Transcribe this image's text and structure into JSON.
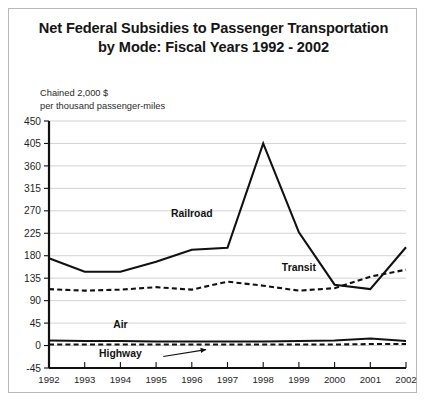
{
  "chart_data": {
    "type": "line",
    "title": "Net Federal Subsidies to Passenger Transportation by Mode: Fiscal Years 1992 - 2002",
    "title_line1": "Net Federal Subsidies to Passenger Transportation",
    "title_line2": "by Mode: Fiscal Years 1992 - 2002",
    "ylabel_line1": "Chained 2,000 $",
    "ylabel_line2": "per thousand passenger-miles",
    "xlabel": "",
    "ylim": [
      -45,
      450
    ],
    "yticks": [
      450,
      405,
      360,
      315,
      270,
      225,
      180,
      135,
      90,
      45,
      0,
      -45
    ],
    "ytick_labels": [
      "450",
      "405",
      "360",
      "315",
      "270",
      "225",
      "180",
      "135",
      "90",
      "45",
      "0",
      "-45"
    ],
    "categories": [
      1992,
      1993,
      1994,
      1995,
      1996,
      1997,
      1998,
      1999,
      2000,
      2001,
      2002
    ],
    "xtick_labels": [
      "1992",
      "1993",
      "1994",
      "1995",
      "1996",
      "1997",
      "1998",
      "1999",
      "2000",
      "2001",
      "2002"
    ],
    "grid": true,
    "legend_position": "inline-annotations",
    "series": [
      {
        "name": "Railroad",
        "style": "solid",
        "color": "#111111",
        "label_x": 1996,
        "label_y": 258,
        "values": [
          175,
          148,
          148,
          168,
          192,
          196,
          405,
          227,
          122,
          113,
          197
        ]
      },
      {
        "name": "Transit",
        "style": "dashed",
        "color": "#111111",
        "label_x": 1999,
        "label_y": 150,
        "values": [
          113,
          110,
          112,
          117,
          112,
          128,
          120,
          110,
          115,
          138,
          152
        ]
      },
      {
        "name": "Air",
        "style": "solid",
        "color": "#111111",
        "label_x": 1994,
        "label_y": 36,
        "values": [
          10,
          9,
          9,
          8,
          8,
          8,
          8,
          9,
          10,
          14,
          9
        ]
      },
      {
        "name": "Highway",
        "style": "dashed",
        "color": "#111111",
        "label_x": 1994,
        "label_y": -22,
        "values": [
          2,
          2,
          2,
          2,
          2,
          2,
          2,
          2,
          2,
          3,
          3
        ]
      }
    ],
    "annotations": [
      {
        "name": "highway-arrow",
        "from": [
          1995.2,
          -22
        ],
        "to": [
          1996.4,
          -8
        ]
      }
    ]
  }
}
